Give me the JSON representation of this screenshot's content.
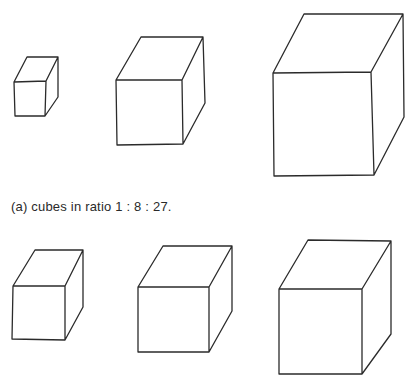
{
  "figure": {
    "caption_a": "(a)  cubes in ratio 1 : 8 : 27.",
    "stroke_color": "#2b2b2b",
    "row_a": [
      {
        "id": "cube-small",
        "front": [
          [
            14,
            82
          ],
          [
            46,
            81
          ],
          [
            45,
            116
          ],
          [
            15,
            116
          ]
        ],
        "back": [
          [
            27,
            57
          ],
          [
            58,
            57
          ],
          [
            58,
            97
          ]
        ]
      },
      {
        "id": "cube-medium",
        "front": [
          [
            116,
            80
          ],
          [
            182,
            80
          ],
          [
            183,
            144
          ],
          [
            117,
            145
          ]
        ],
        "back": [
          [
            141,
            37
          ],
          [
            203,
            37
          ],
          [
            205,
            103
          ]
        ]
      },
      {
        "id": "cube-large",
        "front": [
          [
            273,
            73
          ],
          [
            371,
            72
          ],
          [
            374,
            175
          ],
          [
            274,
            176
          ]
        ],
        "back": [
          [
            304,
            14
          ],
          [
            403,
            14
          ],
          [
            404,
            117
          ]
        ]
      }
    ],
    "row_b": [
      {
        "id": "cube-b1",
        "front": [
          [
            13,
            286
          ],
          [
            65,
            286
          ],
          [
            65,
            340
          ],
          [
            12,
            339
          ]
        ],
        "back": [
          [
            35,
            250
          ],
          [
            83,
            250
          ],
          [
            83,
            307
          ]
        ]
      },
      {
        "id": "cube-b2",
        "front": [
          [
            138,
            287
          ],
          [
            209,
            287
          ],
          [
            209,
            352
          ],
          [
            138,
            352
          ]
        ],
        "back": [
          [
            163,
            246
          ],
          [
            232,
            246
          ],
          [
            232,
            311
          ]
        ]
      },
      {
        "id": "cube-b3",
        "front": [
          [
            279,
            289
          ],
          [
            362,
            289
          ],
          [
            362,
            374
          ],
          [
            279,
            374
          ]
        ],
        "back": [
          [
            308,
            240
          ],
          [
            391,
            241
          ],
          [
            391,
            334
          ]
        ]
      }
    ]
  }
}
